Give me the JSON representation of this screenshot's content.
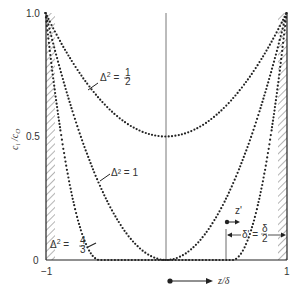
{
  "chart_data": {
    "type": "line",
    "title": "",
    "xlabel": "z/δ",
    "ylabel": "c_i / c_O",
    "xlim": [
      -1,
      1
    ],
    "ylim": [
      0,
      1.0
    ],
    "x_ticks": [
      "-1",
      "1"
    ],
    "y_ticks": [
      "0",
      "0.5",
      "1.0"
    ],
    "grid": false,
    "legend": null,
    "series": [
      {
        "name": "Δ² = 1/2",
        "x": [
          -1,
          -0.5,
          0,
          0.5,
          1
        ],
        "values": [
          1.0,
          0.62,
          0.5,
          0.62,
          1.0
        ]
      },
      {
        "name": "Δ² = 1",
        "x": [
          -1,
          -0.5,
          0,
          0.5,
          1
        ],
        "values": [
          1.0,
          0.25,
          0.0,
          0.25,
          1.0
        ]
      },
      {
        "name": "Δ² = 4/3",
        "x": [
          -1,
          -0.75,
          -0.55,
          0.55,
          0.75,
          1
        ],
        "values": [
          1.0,
          0.3,
          0.0,
          0.0,
          0.3,
          1.0
        ]
      }
    ],
    "annotations": [
      {
        "text": "Δ² = 1/2",
        "x": -0.55,
        "y": 0.75
      },
      {
        "text": "Δ² = 1",
        "x": -0.5,
        "y": 0.4
      },
      {
        "text": "Δ² = 4/3",
        "x": -0.88,
        "y": 0.07
      },
      {
        "text": "z'",
        "x": 0.62,
        "y": 0.2
      },
      {
        "text": "δ' = δ/2",
        "x": 0.75,
        "y": 0.1
      }
    ]
  },
  "labels": {
    "y_axis": "c",
    "y_axis_sub": "i",
    "y_axis_den": "c",
    "y_axis_den_sub": "O",
    "y_tick_top": "1.0",
    "y_tick_mid": "0.5",
    "y_tick_bottom": "0",
    "x_tick_left": "−1",
    "x_tick_right": "1",
    "x_axis": "z/δ",
    "ann_half": "Δ",
    "ann_half_rhs": "=",
    "ann_one": "Δ² = 1",
    "ann_43": "Δ",
    "z_prime": "z'",
    "delta_prime": "δ' =",
    "num_half": "1",
    "den_half": "2",
    "num_43": "4",
    "den_43": "3",
    "num_d": "δ",
    "den_d": "2",
    "sup2": "2"
  }
}
